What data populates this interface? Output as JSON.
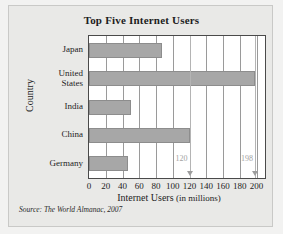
{
  "figure": {
    "title": "Top Five Internet Users",
    "source": "Source: The World Almanac, 2007"
  },
  "chart_data": {
    "type": "bar",
    "orientation": "horizontal",
    "title": "Top Five Internet Users",
    "xlabel": "Internet Users (in millions)",
    "ylabel": "Country",
    "categories": [
      "Japan",
      "United States",
      "India",
      "China",
      "Germany"
    ],
    "values": [
      87,
      198,
      50,
      120,
      47
    ],
    "xlim": [
      0,
      210
    ],
    "xticks": [
      0,
      20,
      40,
      60,
      80,
      100,
      120,
      140,
      160,
      180,
      200
    ],
    "xtick_labels": [
      "0",
      "20",
      "40",
      "60",
      "80",
      "100",
      "120",
      "140",
      "160",
      "180",
      "200"
    ],
    "grid": "vertical",
    "legend": "none",
    "bar_color": "#a7a7a7",
    "annotations": [
      {
        "label": "120",
        "value": 120,
        "marker": "down-arrow"
      },
      {
        "label": "198",
        "value": 198,
        "marker": "down-arrow"
      }
    ]
  },
  "axis": {
    "x_title_main": "Internet Users",
    "x_title_sub": "(in millions)",
    "y_title": "Country"
  }
}
